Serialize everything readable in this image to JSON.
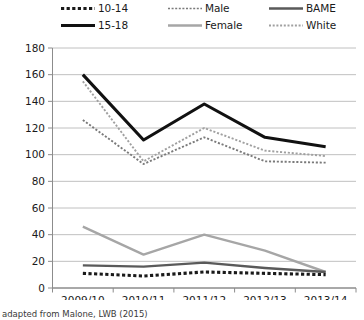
{
  "chart_data": {
    "type": "line",
    "title": "",
    "xlabel": "",
    "ylabel": "",
    "categories": [
      "2009/10",
      "2010/11",
      "2011/12",
      "2012/13",
      "2013/14"
    ],
    "ylim": [
      0,
      180
    ],
    "ytick_step": 20,
    "yticks": [
      "0",
      "20",
      "40",
      "60",
      "80",
      "100",
      "120",
      "140",
      "160",
      "180"
    ],
    "grid": "horizontal",
    "legend_position": "top",
    "legend_columns": 3,
    "legend_rows": 2,
    "series": [
      {
        "name": "10-14",
        "style": "dotted-thick",
        "color": "#1a1a1a",
        "legend_row": 0,
        "legend_col": 0,
        "values": [
          11,
          9,
          12,
          11,
          10
        ]
      },
      {
        "name": "Male",
        "style": "dotted-fine",
        "color": "#7a7a7a",
        "legend_row": 0,
        "legend_col": 1,
        "values": [
          126,
          93,
          113,
          95,
          94
        ]
      },
      {
        "name": "BAME",
        "style": "solid",
        "color": "#5a5a5a",
        "legend_row": 0,
        "legend_col": 2,
        "values": [
          17,
          16,
          19,
          15,
          12
        ]
      },
      {
        "name": "15-18",
        "style": "solid-thick",
        "color": "#111111",
        "legend_row": 1,
        "legend_col": 0,
        "values": [
          160,
          111,
          138,
          113,
          106
        ]
      },
      {
        "name": "Female",
        "style": "solid",
        "color": "#a6a6a6",
        "legend_row": 1,
        "legend_col": 1,
        "values": [
          46,
          25,
          40,
          28,
          12
        ]
      },
      {
        "name": "White",
        "style": "dotted-fine",
        "color": "#a0a0a0",
        "legend_row": 1,
        "legend_col": 2,
        "values": [
          155,
          95,
          120,
          103,
          99
        ]
      }
    ]
  },
  "caption": {
    "text": "adapted from Malone, LWB (2015)"
  },
  "colors": {
    "axis": "#8c8c8c",
    "grid": "#b9b9b9",
    "text": "#1a1a1a",
    "background": "#ffffff"
  }
}
